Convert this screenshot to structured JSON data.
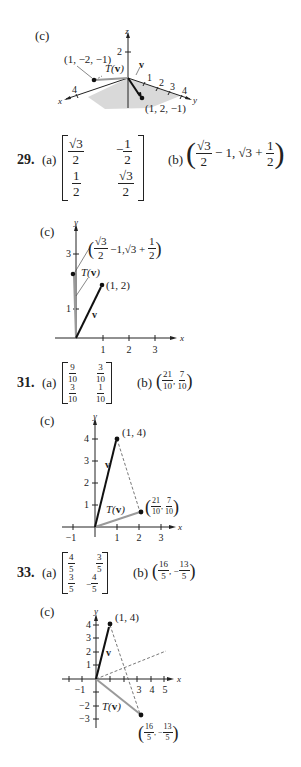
{
  "problems": [
    {
      "id": "27c",
      "part_c_label": "(c)",
      "figure": {
        "type": "3d-vector-plot",
        "axes": {
          "x": "x",
          "y": "y",
          "z": "z"
        },
        "x_ticks": [
          "4"
        ],
        "y_ticks": [
          "1",
          "2",
          "3",
          "4"
        ],
        "z_ticks": [
          "2"
        ],
        "point_T": "(1, −2, −1)",
        "point_v": "(1, 2, −1)",
        "label_T": "T(v)",
        "label_v": "v"
      }
    },
    {
      "number": "29.",
      "part_a_label": "(a)",
      "matrix": [
        [
          "√3",
          "2",
          "−1",
          "2"
        ],
        [
          "1",
          "2",
          "√3",
          "2"
        ]
      ],
      "matrix_cells": {
        "a11_num": "√3",
        "a11_den": "2",
        "a12_sign": "−",
        "a12_num": "1",
        "a12_den": "2",
        "a21_num": "1",
        "a21_den": "2",
        "a22_num": "√3",
        "a22_den": "2"
      },
      "part_b_label": "(b)",
      "part_b": {
        "f1_num": "√3",
        "f1_den": "2",
        "mid": "− 1, √3 +",
        "f2_num": "1",
        "f2_den": "2"
      },
      "part_c_label": "(c)",
      "figure": {
        "axes": {
          "x": "x",
          "y": "y"
        },
        "x_ticks": [
          "1",
          "2",
          "3"
        ],
        "y_ticks": [
          "1",
          "3"
        ],
        "point_v": "(1, 2)",
        "point_T_label_num": "√3",
        "point_T_label_den": "2",
        "point_T_label_mid": "−1,√3 +",
        "point_T_label_f2_num": "1",
        "point_T_label_f2_den": "2",
        "label_T": "T(v)",
        "label_v": "v"
      }
    },
    {
      "number": "31.",
      "part_a_label": "(a)",
      "matrix_cells": {
        "a11_num": "9",
        "a11_den": "10",
        "a12_num": "3",
        "a12_den": "10",
        "a21_num": "3",
        "a21_den": "10",
        "a22_num": "1",
        "a22_den": "10"
      },
      "part_b_label": "(b)",
      "part_b": {
        "f1_num": "21",
        "f1_den": "10",
        "sep": ",",
        "f2_num": "7",
        "f2_den": "10"
      },
      "part_c_label": "(c)",
      "figure": {
        "axes": {
          "x": "x",
          "y": "y"
        },
        "x_ticks": [
          "−1",
          "1",
          "2",
          "3"
        ],
        "y_ticks": [
          "1",
          "2",
          "3",
          "4"
        ],
        "point_v": "(1, 4)",
        "point_T": {
          "f1_num": "21",
          "f1_den": "10",
          "f2_num": "7",
          "f2_den": "10"
        },
        "label_T": "T(v)",
        "label_v": "v"
      }
    },
    {
      "number": "33.",
      "part_a_label": "(a)",
      "matrix_cells": {
        "a11_num": "4",
        "a11_den": "5",
        "a12_num": "3",
        "a12_den": "5",
        "a21_num": "3",
        "a21_den": "5",
        "a22_sign": "−",
        "a22_num": "4",
        "a22_den": "5"
      },
      "part_b_label": "(b)",
      "part_b": {
        "f1_num": "16",
        "f1_den": "5",
        "sep": ", −",
        "f2_num": "13",
        "f2_den": "5"
      },
      "part_c_label": "(c)",
      "figure": {
        "axes": {
          "x": "x",
          "y": "y"
        },
        "x_ticks": [
          "−1",
          "3",
          "4",
          "5"
        ],
        "y_ticks": [
          "4",
          "3",
          "2",
          "1",
          "−2",
          "−3"
        ],
        "point_v": "(1, 4)",
        "point_T": {
          "f1_num": "16",
          "f1_den": "5",
          "sep": ", −",
          "f2_num": "13",
          "f2_den": "5"
        },
        "label_T": "T(v)",
        "label_v": "v"
      }
    }
  ]
}
